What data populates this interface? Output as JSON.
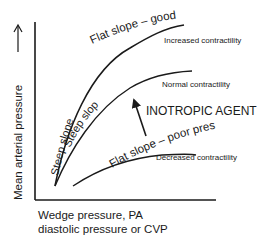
{
  "diagram": {
    "y_axis_label": "Mean arterial pressure",
    "y_axis_arrow": "→",
    "x_axis_label_line1": "Wedge pressure, PA",
    "x_axis_label_line2": "diastolic pressure or CVP",
    "curves": [
      {
        "name": "increased-contractility",
        "label": "Increased contractility",
        "steep_label": "Steep slope",
        "flat_label": "Flat slope – good pressure"
      },
      {
        "name": "normal-contractility",
        "label": "Normal contractility",
        "steep_label": "Steep slope"
      },
      {
        "name": "decreased-contractility",
        "label": "Decreased contractility",
        "flat_label": "Flat slope – poor pressure"
      }
    ],
    "annotation": "INOTROPIC AGENT",
    "line_color": "#1a1a1a"
  }
}
